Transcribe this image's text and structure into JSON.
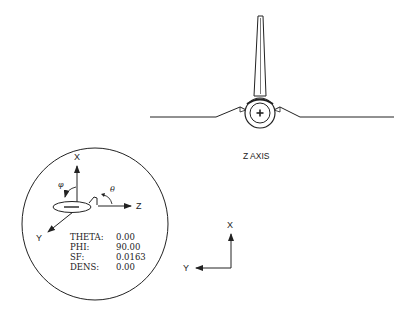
{
  "front_view": {
    "caption": "Z AXIS"
  },
  "orientation_indicator": {
    "axes": {
      "x": "X",
      "y": "Y",
      "z": "Z"
    },
    "angles": {
      "phi_symbol": "φ",
      "theta_symbol": "θ"
    },
    "parameters": [
      {
        "label": "THETA:",
        "value": "0.00"
      },
      {
        "label": "PHI:",
        "value": "90.00"
      },
      {
        "label": "SF:",
        "value": "0.0163"
      },
      {
        "label": "DENS:",
        "value": "0.00"
      }
    ]
  },
  "screen_axes": {
    "x": "X",
    "y": "Y"
  },
  "colors": {
    "line": "#222222",
    "background": "#ffffff"
  }
}
